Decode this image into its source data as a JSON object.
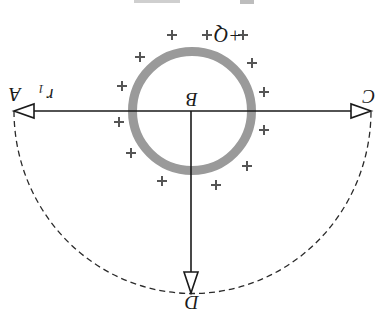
{
  "figure": {
    "orientation": "rotated-180",
    "width": 389,
    "height": 324,
    "colors": {
      "background": "#ffffff",
      "line": "#1a1a1a",
      "shell": "#9a9a9a",
      "plus": "#555555"
    },
    "shell": {
      "label": "+Q",
      "center": [
        192,
        111
      ],
      "outer_radius": 64,
      "thickness": 9
    },
    "center_label": "B",
    "points": {
      "A": {
        "label": "A",
        "pos": [
          14,
          111
        ]
      },
      "C": {
        "label": "C",
        "pos": [
          371,
          111
        ]
      },
      "D": {
        "label": "D",
        "pos": [
          191,
          293
        ]
      }
    },
    "radius_label": "r",
    "radius_subscript": "1",
    "plus_sign": "+",
    "plus_positions": [
      [
        172,
        35
      ],
      [
        207,
        35
      ],
      [
        243,
        35
      ],
      [
        140,
        57
      ],
      [
        252,
        63
      ],
      [
        122,
        86
      ],
      [
        264,
        92
      ],
      [
        119,
        122
      ],
      [
        264,
        130
      ],
      [
        131,
        153
      ],
      [
        247,
        166
      ],
      [
        162,
        181
      ],
      [
        216,
        185
      ]
    ]
  }
}
